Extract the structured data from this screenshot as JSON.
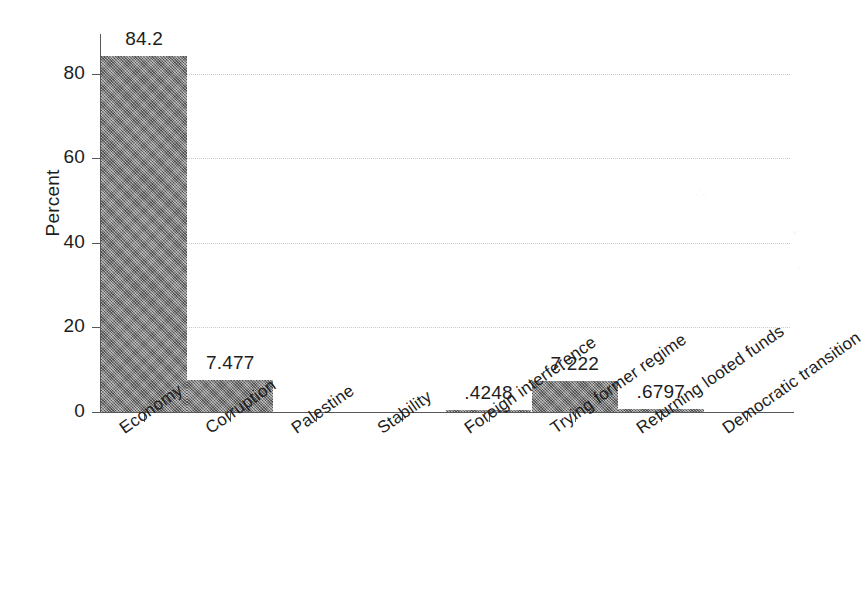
{
  "chart_data": {
    "type": "bar",
    "title": "",
    "subtitle": "",
    "xlabel": "",
    "ylabel": "Percent",
    "ylim": [
      0,
      88
    ],
    "yticks": [
      0,
      20,
      40,
      60,
      80
    ],
    "ytick_labels": [
      "0",
      "20",
      "40",
      "60",
      "80"
    ],
    "grid": "horizontal-dotted",
    "legend": "none",
    "bar_color": "#7d7d7d",
    "categories": [
      "Economy",
      "Corruption",
      "Palestine",
      "Stability",
      "Foreign interference",
      "Trying former regime",
      "Returning looted funds",
      "Democratic transition"
    ],
    "values": [
      84.2,
      7.477,
      0,
      0,
      0.4248,
      7.222,
      0.6797,
      0
    ],
    "value_labels": [
      "84.2",
      "7.477",
      "",
      "",
      ".4248",
      "7.222",
      ".6797",
      ""
    ],
    "value_labels_shown": [
      true,
      true,
      false,
      false,
      true,
      true,
      true,
      false
    ]
  },
  "axis": {
    "y_title": "Percent"
  }
}
